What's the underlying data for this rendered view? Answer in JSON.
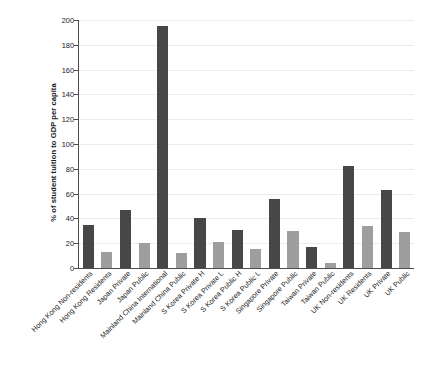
{
  "chart_data": {
    "type": "bar",
    "title": "",
    "subtitle": "",
    "xlabel": "",
    "ylabel": "% of student tuition to GDP per capita",
    "ylim": [
      0,
      200
    ],
    "yticks": [
      0,
      20,
      40,
      60,
      80,
      100,
      120,
      140,
      160,
      180,
      200
    ],
    "grid": true,
    "legend": "none",
    "categories": [
      "Hong Kong Non-residents",
      "Hong Kong Residents",
      "Japan Private",
      "Japan Public",
      "Mainland China International",
      "Mainland China Public",
      "S Korea Private H",
      "S Korea Private L",
      "S Korea Public H",
      "S Korea Public L",
      "Singapore Private",
      "Singapore Public",
      "Taiwan Private",
      "Taiwan Public",
      "UK Non-residents",
      "UK Residents",
      "UK Private",
      "UK Public"
    ],
    "values": [
      35,
      13,
      47,
      20,
      195,
      12,
      40,
      21,
      31,
      15,
      56,
      30,
      17,
      4,
      82,
      34,
      63,
      29
    ],
    "bar_shades": [
      "dark",
      "light",
      "dark",
      "light",
      "dark",
      "light",
      "dark",
      "light",
      "dark",
      "light",
      "dark",
      "light",
      "dark",
      "light",
      "dark",
      "light",
      "dark",
      "light"
    ],
    "colors": {
      "bar_dark": "#474747",
      "bar_light": "#9e9e9e",
      "axis": "#4d4d4d",
      "grid": "#eceaea",
      "text": "#1a1a1a",
      "background": "#ffffff"
    }
  },
  "axis": {
    "y_title": "% of student tuition to GDP per capita",
    "y_tick_labels": [
      "0",
      "20",
      "40",
      "60",
      "80",
      "100",
      "120",
      "140",
      "160",
      "180",
      "200"
    ]
  }
}
